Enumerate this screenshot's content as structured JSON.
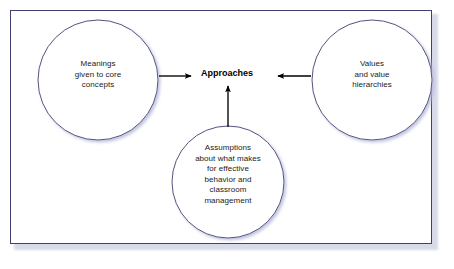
{
  "figure": {
    "type": "concept-diagram",
    "title_text": "Approaches",
    "frame": {
      "border_color": "#3f4070",
      "shadow_color": "#b8bcd8",
      "background": "#ffffff"
    },
    "circle_style": {
      "stroke_color": "#3f4070",
      "fill": "#ffffff",
      "shadow_color": "#c2c6de"
    },
    "arrow_color": "#000000",
    "text_color": "#1b1b1b",
    "nodes": [
      {
        "id": "meanings",
        "label": "Meanings\ngiven to core\nconcepts",
        "position": "left",
        "cx": 98,
        "cy": 80,
        "r": 60
      },
      {
        "id": "values",
        "label": "Values\nand value\nhierarchies",
        "position": "right",
        "cx": 372,
        "cy": 80,
        "r": 60
      },
      {
        "id": "assumptions",
        "label": "Assumptions\nabout what makes\nfor effective\nbehavior and\nclassroom\nmanagement",
        "position": "bottom",
        "cx": 228,
        "cy": 182,
        "r": 56
      }
    ],
    "center": {
      "id": "approaches",
      "label": "Approaches",
      "cx": 227,
      "cy": 76
    },
    "arrows": [
      {
        "id": "left-to-center",
        "from": "meanings",
        "to": "approaches",
        "direction": "right"
      },
      {
        "id": "right-to-center",
        "from": "values",
        "to": "approaches",
        "direction": "left"
      },
      {
        "id": "bottom-to-center",
        "from": "assumptions",
        "to": "approaches",
        "direction": "up"
      }
    ]
  }
}
